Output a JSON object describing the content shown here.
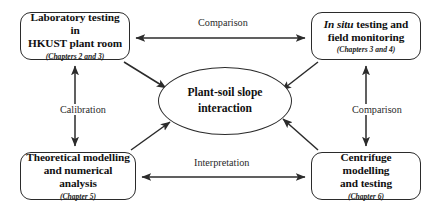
{
  "diagram": {
    "stroke_color": "#2b2b2b",
    "text_color": "#111111",
    "background": "#ffffff"
  },
  "hub": {
    "name": "plant-soil-slope-interaction",
    "line1": "Plant-soil slope",
    "line2": "interaction",
    "shape": "ellipse"
  },
  "nodes": [
    {
      "id": "laboratory-testing",
      "title_part1": "Laboratory testing in",
      "title_part2": "HKUST plant room",
      "subtitle": "(Chapters 2 and 3)",
      "position": "top-left"
    },
    {
      "id": "in-situ-testing",
      "title_italic": "In situ",
      "title_part1": " testing and",
      "title_part2": "field monitoring",
      "subtitle": "(Chapters 3 and 4)",
      "position": "top-right"
    },
    {
      "id": "theoretical-modelling",
      "title_part1": "Theoretical modelling",
      "title_part2": "and numerical analysis",
      "subtitle": "(Chapter 5)",
      "position": "bottom-left"
    },
    {
      "id": "centrifuge-modelling",
      "title_part1": "Centrifuge modelling",
      "title_part2": "and testing",
      "subtitle": "(Chapter 6)",
      "position": "bottom-right"
    }
  ],
  "edge_labels": {
    "top": "Comparison",
    "bottom": "Interpretation",
    "left": "Calibration",
    "right": "Comparison"
  },
  "edges": [
    {
      "id": "lab-to-insitu",
      "label": "Comparison",
      "arrow": "bidirectional"
    },
    {
      "id": "theory-to-centrifuge",
      "label": "Interpretation",
      "arrow": "bidirectional"
    },
    {
      "id": "lab-to-theory",
      "label": "Calibration",
      "arrow": "bidirectional"
    },
    {
      "id": "insitu-to-centrifuge",
      "label": "Comparison",
      "arrow": "bidirectional"
    },
    {
      "id": "lab-to-hub",
      "label": "",
      "arrow": "into-hub"
    },
    {
      "id": "insitu-to-hub",
      "label": "",
      "arrow": "into-hub"
    },
    {
      "id": "theory-to-hub",
      "label": "",
      "arrow": "into-hub"
    },
    {
      "id": "centrifuge-to-hub",
      "label": "",
      "arrow": "into-hub"
    }
  ]
}
